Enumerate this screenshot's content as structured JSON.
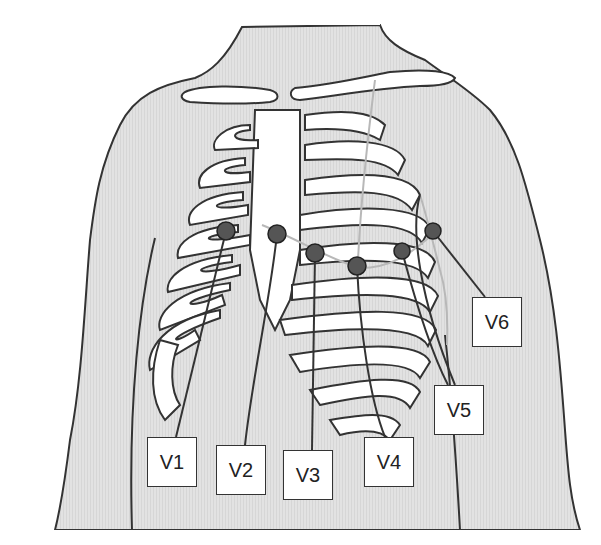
{
  "figure": {
    "colors": {
      "skin": "#e0e0e0",
      "outline": "#333333",
      "bone": "#ffffff",
      "electrode": "#555555",
      "guide_line": "#b8b8b8",
      "background": "#ffffff"
    },
    "leads": [
      {
        "id": "V1",
        "label": "V1",
        "electrode": {
          "x": 226,
          "y": 231
        },
        "box": {
          "x": 147,
          "y": 437
        }
      },
      {
        "id": "V2",
        "label": "V2",
        "electrode": {
          "x": 277,
          "y": 234
        },
        "box": {
          "x": 216,
          "y": 445
        }
      },
      {
        "id": "V3",
        "label": "V3",
        "electrode": {
          "x": 315,
          "y": 253
        },
        "box": {
          "x": 283,
          "y": 450
        }
      },
      {
        "id": "V4",
        "label": "V4",
        "electrode": {
          "x": 357,
          "y": 266
        },
        "box": {
          "x": 364,
          "y": 437
        }
      },
      {
        "id": "V5",
        "label": "V5",
        "electrode": {
          "x": 402,
          "y": 251
        },
        "box": {
          "x": 434,
          "y": 385
        }
      },
      {
        "id": "V6",
        "label": "V6",
        "electrode": {
          "x": 433,
          "y": 231
        },
        "box": {
          "x": 472,
          "y": 297
        }
      }
    ]
  }
}
